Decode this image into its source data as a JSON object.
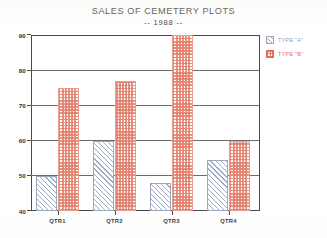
{
  "chart_data": {
    "type": "bar",
    "title": "SALES OF CEMETERY PLOTS",
    "subtitle": "-- 1988 --",
    "xlabel": "",
    "ylabel": "",
    "categories": [
      "QTR1",
      "QTR2",
      "QTR3",
      "QTR4"
    ],
    "series": [
      {
        "name": "TYPE \"A\"",
        "values": [
          50,
          60,
          48,
          54.5
        ],
        "color": "#9aa9bd",
        "pattern": "diagonal-hatch"
      },
      {
        "name": "TYPE \"B\"",
        "values": [
          75,
          77,
          90,
          60
        ],
        "color": "#e26a53",
        "pattern": "cross-hatch"
      }
    ],
    "ylim": [
      40,
      90
    ],
    "yticks": [
      40,
      50,
      60,
      70,
      80,
      90
    ],
    "ytick_labels": [
      "40",
      "50",
      "60",
      "70",
      "80",
      "90"
    ],
    "grid": true,
    "grid_axis": "y",
    "legend_position": "right-top"
  },
  "legend": {
    "items": [
      {
        "label": "TYPE \"A\""
      },
      {
        "label": "TYPE \"B\""
      }
    ]
  }
}
